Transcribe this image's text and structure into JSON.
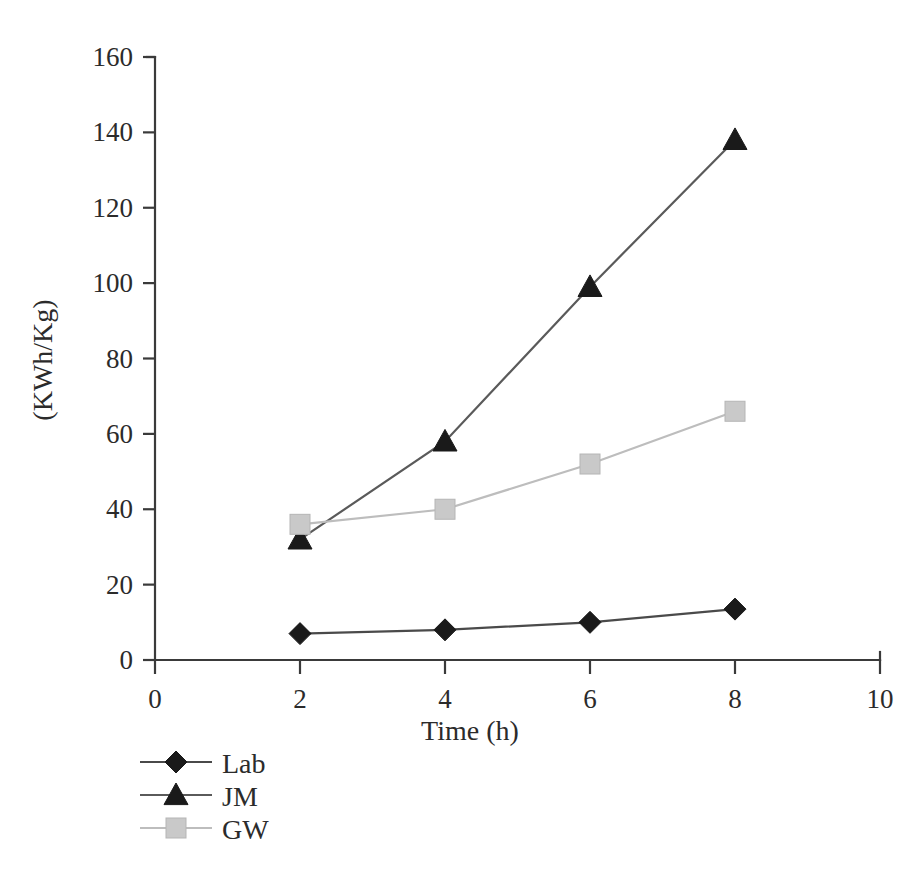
{
  "chart_data": {
    "type": "line",
    "title": "",
    "subtitle": "",
    "xlabel": "Time (h)",
    "ylabel": "(KWh/Kg)",
    "x": [
      2,
      4,
      6,
      8
    ],
    "xlim": [
      0,
      10
    ],
    "ylim": [
      0,
      160
    ],
    "xticks": [
      "0",
      "2",
      "4",
      "6",
      "8",
      "10"
    ],
    "xtick_values": [
      0,
      2,
      4,
      6,
      8,
      10
    ],
    "yticks": [
      "0",
      "20",
      "40",
      "60",
      "80",
      "100",
      "120",
      "140",
      "160"
    ],
    "ytick_values": [
      0,
      20,
      40,
      60,
      80,
      100,
      120,
      140,
      160
    ],
    "grid": false,
    "legend_position": "below-left",
    "series": [
      {
        "name": "Lab",
        "marker": "diamond",
        "color": "#1a1a1a",
        "line_color": "#4a4a4a",
        "values": [
          7,
          8,
          10,
          13.5
        ]
      },
      {
        "name": "JM",
        "marker": "triangle",
        "color": "#1a1a1a",
        "line_color": "#5a5a5a",
        "values": [
          32,
          58,
          99,
          138
        ]
      },
      {
        "name": "GW",
        "marker": "square",
        "color": "#c9c9c9",
        "line_color": "#bdbdbd",
        "values": [
          36,
          40,
          52,
          66
        ]
      }
    ]
  },
  "legend": {
    "items": [
      {
        "label": "Lab"
      },
      {
        "label": "JM"
      },
      {
        "label": "GW"
      }
    ]
  },
  "axes": {
    "x_title": "Time (h)",
    "y_title": "(KWh/Kg)"
  }
}
